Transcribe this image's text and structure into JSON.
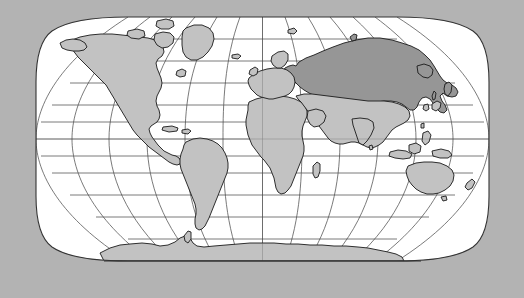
{
  "figure": {
    "kind": "world-map",
    "title": "",
    "projection": "Robinson",
    "background_color": "#b3b3b3",
    "ocean_color": "#ffffff",
    "land_color": "#c2c2c2",
    "highlight_color": "#969696",
    "outline_color": "#1a1a1a",
    "graticule_color": "#4d4d4d",
    "frame_color": "#333333"
  },
  "map_extent": {
    "left_px": 36,
    "right_px": 489,
    "top_px": 17,
    "bottom_px": 261,
    "center_x_px": 262.5,
    "center_y_px": 139,
    "half_width_px": 226.5,
    "half_height_px": 122
  },
  "graticule": {
    "meridian_interval_deg": 30,
    "parallel_interval_deg": 15,
    "meridians_deg": [
      -180,
      -150,
      -120,
      -90,
      -60,
      -30,
      0,
      30,
      60,
      90,
      120,
      150,
      180
    ],
    "parallels_deg": [
      75,
      60,
      45,
      30,
      15,
      0,
      -15,
      -30,
      -45,
      -60,
      -75
    ],
    "grid_visible": true,
    "labels_visible": false
  },
  "highlighted_regions": [
    {
      "name": "Russia",
      "fill": "#969696",
      "role": "selected-country"
    }
  ],
  "landmasses": [
    {
      "name": "North America",
      "fill": "#c2c2c2"
    },
    {
      "name": "South America",
      "fill": "#c2c2c2"
    },
    {
      "name": "Greenland",
      "fill": "#c2c2c2"
    },
    {
      "name": "Europe",
      "fill": "#c2c2c2"
    },
    {
      "name": "Africa",
      "fill": "#c2c2c2"
    },
    {
      "name": "Asia",
      "fill": "#c2c2c2"
    },
    {
      "name": "Russia",
      "fill": "#969696"
    },
    {
      "name": "Australia",
      "fill": "#c2c2c2"
    },
    {
      "name": "Antarctica",
      "fill": "#c2c2c2"
    },
    {
      "name": "Madagascar",
      "fill": "#c2c2c2"
    },
    {
      "name": "New Zealand",
      "fill": "#c2c2c2"
    },
    {
      "name": "Japan",
      "fill": "#c2c2c2"
    },
    {
      "name": "Indonesia",
      "fill": "#c2c2c2"
    },
    {
      "name": "Philippines",
      "fill": "#c2c2c2"
    },
    {
      "name": "Borneo",
      "fill": "#c2c2c2"
    },
    {
      "name": "New Guinea",
      "fill": "#c2c2c2"
    },
    {
      "name": "British Isles",
      "fill": "#c2c2c2"
    },
    {
      "name": "Iceland",
      "fill": "#c2c2c2"
    },
    {
      "name": "Sri Lanka",
      "fill": "#c2c2c2"
    },
    {
      "name": "Cuba",
      "fill": "#c2c2c2"
    },
    {
      "name": "Svalbard",
      "fill": "#c2c2c2"
    },
    {
      "name": "Novaya Zemlya",
      "fill": "#969696"
    },
    {
      "name": "Sakhalin",
      "fill": "#969696"
    },
    {
      "name": "Tasmania",
      "fill": "#c2c2c2"
    },
    {
      "name": "Taiwan",
      "fill": "#c2c2c2"
    },
    {
      "name": "Hispaniola",
      "fill": "#c2c2c2"
    },
    {
      "name": "Newfoundland",
      "fill": "#c2c2c2"
    },
    {
      "name": "Baffin Island",
      "fill": "#c2c2c2"
    },
    {
      "name": "Victoria Island",
      "fill": "#c2c2c2"
    },
    {
      "name": "Ellesmere Island",
      "fill": "#c2c2c2"
    }
  ]
}
